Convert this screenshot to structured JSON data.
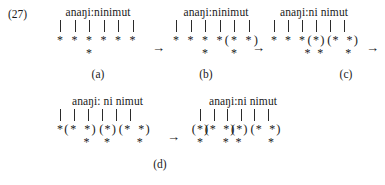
{
  "figure": {
    "example_number": "(27)",
    "arrow_glyph": "→",
    "asterisk_glyph": "*",
    "paren_open": "(",
    "paren_close": ")"
  },
  "panels": [
    {
      "id": "a",
      "caption": "(a)",
      "word": "anaŋi:ninimut",
      "bars": 6,
      "row1": [
        {
          "type": "ast",
          "col": 0
        },
        {
          "type": "ast",
          "col": 1
        },
        {
          "type": "ast",
          "col": 2
        },
        {
          "type": "ast",
          "col": 3
        },
        {
          "type": "ast",
          "col": 4
        },
        {
          "type": "ast",
          "col": 5
        }
      ],
      "row2": [
        {
          "type": "ast",
          "col": 2
        }
      ]
    },
    {
      "id": "b",
      "caption": "(b)",
      "word": "anaŋi:ninimut",
      "bars": 6,
      "row1": [
        {
          "type": "ast",
          "col": 0
        },
        {
          "type": "ast",
          "col": 1
        },
        {
          "type": "ast",
          "col": 2
        },
        {
          "type": "ast",
          "col": 3
        },
        {
          "type": "paren-open",
          "col": 3.5
        },
        {
          "type": "ast",
          "col": 4
        },
        {
          "type": "ast",
          "col": 5
        },
        {
          "type": "paren-close",
          "col": 5.5
        }
      ],
      "row2": [
        {
          "type": "ast",
          "col": 2
        },
        {
          "type": "ast",
          "col": 4
        }
      ]
    },
    {
      "id": "c",
      "caption": "(c)",
      "word": "anaŋi:ni nimut",
      "bars": 6,
      "row1": [
        {
          "type": "ast",
          "col": 0
        },
        {
          "type": "ast",
          "col": 1
        },
        {
          "type": "ast",
          "col": 2
        },
        {
          "type": "paren-open",
          "col": 2.55
        },
        {
          "type": "ast",
          "col": 3
        },
        {
          "type": "paren-close",
          "col": 3.45
        },
        {
          "type": "paren-open",
          "col": 3.95
        },
        {
          "type": "ast",
          "col": 4.4
        },
        {
          "type": "ast",
          "col": 5.4
        },
        {
          "type": "paren-close",
          "col": 5.85
        }
      ],
      "row2": [
        {
          "type": "ast",
          "col": 2.4
        },
        {
          "type": "ast",
          "col": 3.3
        },
        {
          "type": "ast",
          "col": 5.3
        }
      ]
    },
    {
      "id": "d-left",
      "caption": "",
      "word": "anaŋi: ni nimut",
      "bars": 6,
      "row1": [
        {
          "type": "ast",
          "col": 0
        },
        {
          "type": "paren-open",
          "col": 0.45
        },
        {
          "type": "ast",
          "col": 0.95
        },
        {
          "type": "ast",
          "col": 1.95
        },
        {
          "type": "paren-close",
          "col": 2.4
        },
        {
          "type": "paren-open",
          "col": 2.95
        },
        {
          "type": "ast",
          "col": 3.4
        },
        {
          "type": "paren-close",
          "col": 3.85
        },
        {
          "type": "paren-open",
          "col": 4.35
        },
        {
          "type": "ast",
          "col": 4.8
        },
        {
          "type": "ast",
          "col": 5.8
        },
        {
          "type": "paren-close",
          "col": 6.25
        }
      ],
      "row2": [
        {
          "type": "ast",
          "col": 1.9
        },
        {
          "type": "ast",
          "col": 3.35
        },
        {
          "type": "ast",
          "col": 5.7
        }
      ]
    },
    {
      "id": "d-right",
      "caption": "",
      "word": "anaŋi:ni nimut",
      "bars": 6,
      "row1": [
        {
          "type": "paren-open",
          "col": -0.45
        },
        {
          "type": "ast",
          "col": 0
        },
        {
          "type": "paren-close",
          "col": 0.45
        },
        {
          "type": "paren-open",
          "col": 0.5
        },
        {
          "type": "ast",
          "col": 0.95
        },
        {
          "type": "ast",
          "col": 1.95
        },
        {
          "type": "paren-close",
          "col": 2.4
        },
        {
          "type": "paren-open",
          "col": 2.45
        },
        {
          "type": "ast",
          "col": 2.9
        },
        {
          "type": "paren-close",
          "col": 3.35
        },
        {
          "type": "paren-open",
          "col": 3.9
        },
        {
          "type": "ast",
          "col": 4.35
        },
        {
          "type": "ast",
          "col": 5.35
        },
        {
          "type": "paren-close",
          "col": 5.8
        }
      ],
      "row2": [
        {
          "type": "ast",
          "col": 0
        },
        {
          "type": "ast",
          "col": 1.9
        },
        {
          "type": "ast",
          "col": 2.85
        },
        {
          "type": "ast",
          "col": 5.25
        }
      ]
    }
  ],
  "captions": {
    "a": "(a)",
    "b": "(b)",
    "c": "(c)",
    "d": "(d)"
  }
}
